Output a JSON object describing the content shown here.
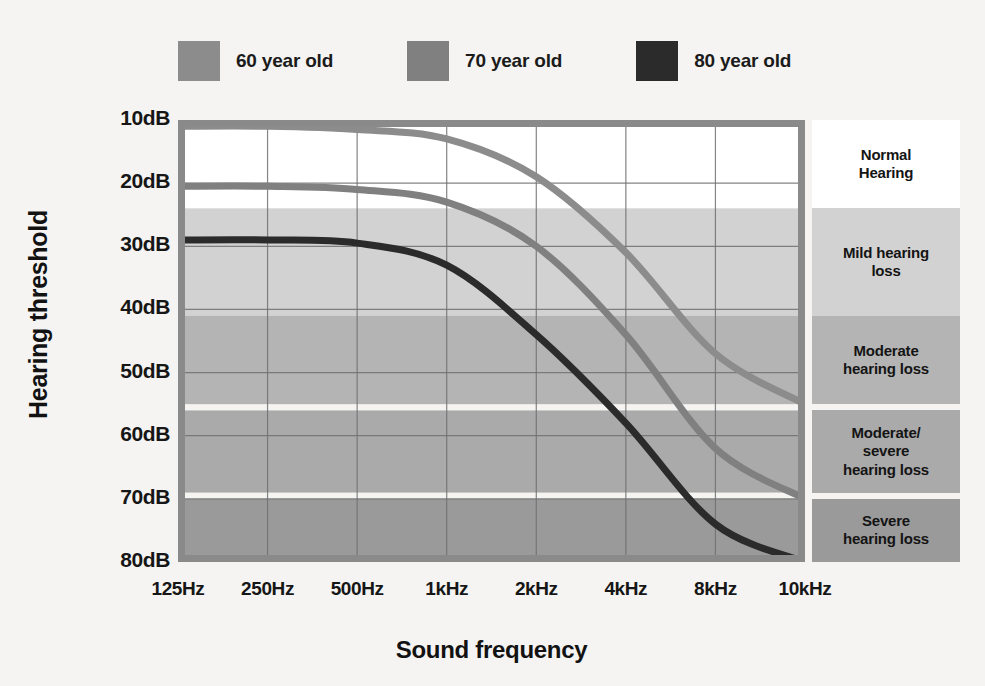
{
  "chart_data": {
    "type": "line",
    "title": "",
    "xlabel": "Sound frequency",
    "ylabel": "Hearing threshold",
    "grid": true,
    "legend_position": "top",
    "x_scale": "log-category",
    "categories": [
      "125Hz",
      "250Hz",
      "500Hz",
      "1kHz",
      "2kHz",
      "4kHz",
      "8kHz",
      "10kHz"
    ],
    "x_values_hz": [
      125,
      250,
      500,
      1000,
      2000,
      4000,
      8000,
      10000
    ],
    "ylim": [
      10,
      80
    ],
    "y_ticks": [
      "10dB",
      "20dB",
      "30dB",
      "40dB",
      "50dB",
      "60dB",
      "70dB",
      "80dB"
    ],
    "y_tick_values": [
      10,
      20,
      30,
      40,
      50,
      60,
      70,
      80
    ],
    "y_axis_inverted": true,
    "series": [
      {
        "name": "60 year old",
        "color": "#8c8c8c",
        "values": [
          11,
          11,
          11.5,
          13,
          19,
          31,
          47,
          55
        ]
      },
      {
        "name": "70 year old",
        "color": "#808080",
        "values": [
          20.5,
          20.5,
          21,
          23,
          30,
          44,
          62,
          70
        ]
      },
      {
        "name": "80 year old",
        "color": "#2b2b2b",
        "values": [
          29,
          29,
          29.5,
          33,
          44,
          58,
          74,
          80
        ]
      }
    ],
    "bands": [
      {
        "label": "Normal\nHearing",
        "from_db": 10,
        "to_db": 24,
        "color": "#ffffff"
      },
      {
        "label": "Mild hearing\nloss",
        "from_db": 24,
        "to_db": 41,
        "color": "#d2d2d2"
      },
      {
        "label": "Moderate\nhearing loss",
        "from_db": 41,
        "to_db": 55,
        "color": "#b4b4b4"
      },
      {
        "label": "Moderate/\nsevere\nhearing loss",
        "from_db": 56,
        "to_db": 69,
        "color": "#aaaaaa"
      },
      {
        "label": "Severe\nhearing loss",
        "from_db": 70,
        "to_db": 80,
        "color": "#9a9a9a"
      }
    ],
    "axis_color": "#8a8a8a",
    "grid_color": "#707070"
  },
  "legend": {
    "items": [
      {
        "label": "60 year old",
        "color": "#8c8c8c"
      },
      {
        "label": "70 year old",
        "color": "#808080"
      },
      {
        "label": "80 year old",
        "color": "#2b2b2b"
      }
    ]
  }
}
